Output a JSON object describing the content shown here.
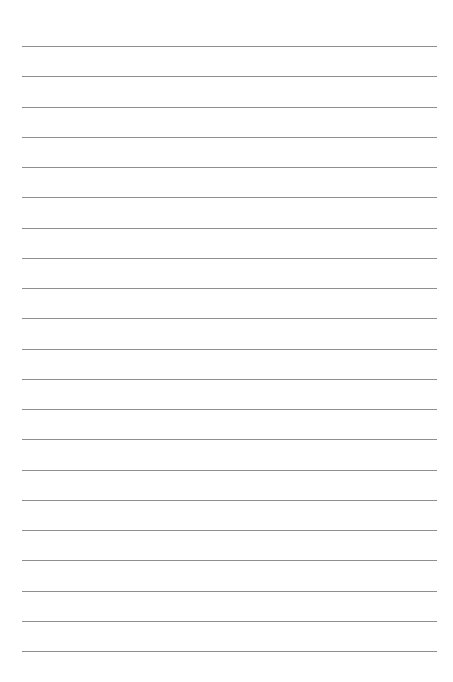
{
  "page": {
    "type": "lined-paper",
    "background_color": "#ffffff",
    "line_color": "#8f8f8f",
    "line_count": 21,
    "first_line_y": 46,
    "line_spacing": 30.25,
    "line_left": 22,
    "line_width": 415,
    "text": ""
  }
}
